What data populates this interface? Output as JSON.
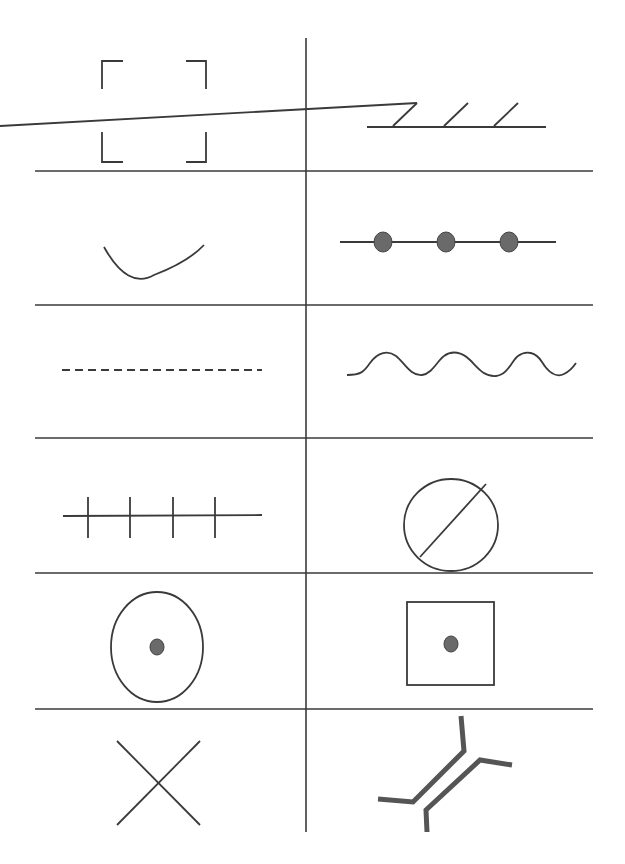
{
  "diagram": {
    "title": "",
    "layout": {
      "rows": 6,
      "columns": 2
    },
    "colors": {
      "line": "#3a3a3a",
      "dot_fill": "#6a6a6a",
      "bridge_stroke": "#555555",
      "background": "#ffffff"
    },
    "cells": [
      {
        "row": 1,
        "col": 1,
        "symbol": "corner-brackets"
      },
      {
        "row": 1,
        "col": 2,
        "symbol": "hatched-line"
      },
      {
        "row": 2,
        "col": 1,
        "symbol": "arc"
      },
      {
        "row": 2,
        "col": 2,
        "symbol": "line-with-dots",
        "dot_count": 3
      },
      {
        "row": 3,
        "col": 1,
        "symbol": "dashed-line"
      },
      {
        "row": 3,
        "col": 2,
        "symbol": "wavy-line"
      },
      {
        "row": 4,
        "col": 1,
        "symbol": "line-with-ticks",
        "tick_count": 4
      },
      {
        "row": 4,
        "col": 2,
        "symbol": "circle-with-slash"
      },
      {
        "row": 5,
        "col": 1,
        "symbol": "circle-with-center-dot"
      },
      {
        "row": 5,
        "col": 2,
        "symbol": "square-with-center-dot"
      },
      {
        "row": 6,
        "col": 1,
        "symbol": "x-cross"
      },
      {
        "row": 6,
        "col": 2,
        "symbol": "bridge"
      }
    ]
  }
}
